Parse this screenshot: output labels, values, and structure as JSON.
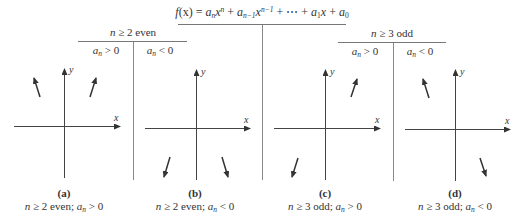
{
  "title": {
    "function_label": "f(x) = a_n x^n + a_{n-1} x^{n-1} + ⋯ + a_1 x + a_0",
    "parts": {
      "f": "f",
      "lhs": "(x) = ",
      "a": "a",
      "n": "n",
      "x": "x",
      "plus": " + ",
      "n_minus_1": "n−1",
      "ellipsis": "⋯",
      "one": "1",
      "zero": "0"
    }
  },
  "branches": [
    {
      "header": "n ≥ 2 even",
      "header_parts": {
        "var": "n",
        "rest": " ≥ 2 even"
      },
      "sub": [
        {
          "label": "a_n > 0",
          "rel": " > 0"
        },
        {
          "label": "a_n < 0",
          "rel": " < 0"
        }
      ]
    },
    {
      "header": "n ≥ 3 odd",
      "header_parts": {
        "var": "n",
        "rest": " ≥ 3 odd"
      },
      "sub": [
        {
          "label": "a_n > 0",
          "rel": " > 0"
        },
        {
          "label": "a_n < 0",
          "rel": " < 0"
        }
      ]
    }
  ],
  "panels": [
    {
      "id": "a",
      "letter": "(a)",
      "caption": "n ≥ 2 even; a_n > 0",
      "caption_rest": " ≥ 2 even; ",
      "rel": " > 0",
      "end_behavior": {
        "left": "up",
        "right": "up"
      }
    },
    {
      "id": "b",
      "letter": "(b)",
      "caption": "n ≥ 2 even; a_n < 0",
      "caption_rest": " ≥ 2 even; ",
      "rel": " < 0",
      "end_behavior": {
        "left": "down",
        "right": "down"
      }
    },
    {
      "id": "c",
      "letter": "(c)",
      "caption": "n ≥ 3 odd; a_n > 0",
      "caption_rest": " ≥ 3 odd; ",
      "rel": " > 0",
      "end_behavior": {
        "left": "down",
        "right": "up"
      }
    },
    {
      "id": "d",
      "letter": "(d)",
      "caption": "n ≥ 3 odd; a_n < 0",
      "caption_rest": " ≥ 3 odd; ",
      "rel": " < 0",
      "end_behavior": {
        "left": "up",
        "right": "down"
      }
    }
  ],
  "axes": {
    "x_label": "x",
    "y_label": "y"
  },
  "colors": {
    "line": "#555555",
    "axis": "#444444",
    "arrow": "#333333",
    "divider": "#777777"
  }
}
